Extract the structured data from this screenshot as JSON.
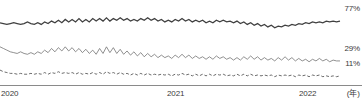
{
  "chart_data": {
    "type": "line",
    "title": "",
    "xlabel": "(年)",
    "ylabel": "",
    "grid": false,
    "legend_position": "right-end-labels",
    "xlim": [
      2020.0,
      2022.95
    ],
    "ylim": [
      0,
      100
    ],
    "x_tick_labels": [
      "2020",
      "2021",
      "2022"
    ],
    "x_tick_values": [
      2020,
      2021,
      2022
    ],
    "end_labels": [
      "77%",
      "29%",
      "11%"
    ],
    "series": [
      {
        "name": "77%",
        "end_label": "77%",
        "style": "solid-thick",
        "color": "#404040",
        "values": [
          75,
          74,
          73,
          74,
          75,
          74,
          73,
          74,
          76,
          74,
          73,
          75,
          73,
          76,
          74,
          77,
          75,
          78,
          75,
          79,
          76,
          79,
          76,
          80,
          76,
          79,
          76,
          80,
          77,
          80,
          77,
          81,
          77,
          80,
          78,
          81,
          78,
          80,
          77,
          79,
          77,
          80,
          78,
          81,
          78,
          80,
          77,
          79,
          76,
          78,
          76,
          79,
          77,
          80,
          77,
          79,
          76,
          78,
          76,
          78,
          75,
          77,
          75,
          78,
          76,
          78,
          76,
          77,
          75,
          77,
          74,
          76,
          73,
          75,
          72,
          74,
          71,
          73,
          70,
          72,
          69,
          71,
          70,
          72,
          71,
          73,
          72,
          74,
          73,
          75,
          74,
          76,
          75,
          76,
          75,
          77,
          76,
          77,
          76,
          77
        ]
      },
      {
        "name": "29%",
        "end_label": "29%",
        "style": "solid-thin",
        "color": "#6b6b6b",
        "values": [
          46,
          44,
          42,
          40,
          39,
          38,
          40,
          38,
          37,
          39,
          37,
          40,
          38,
          42,
          39,
          44,
          40,
          45,
          41,
          46,
          41,
          45,
          40,
          44,
          39,
          43,
          38,
          42,
          37,
          44,
          38,
          46,
          39,
          45,
          38,
          43,
          37,
          41,
          36,
          40,
          35,
          39,
          34,
          38,
          34,
          37,
          33,
          36,
          33,
          35,
          32,
          36,
          33,
          37,
          33,
          36,
          32,
          35,
          32,
          34,
          31,
          34,
          31,
          35,
          32,
          34,
          31,
          33,
          30,
          33,
          30,
          34,
          31,
          35,
          31,
          34,
          30,
          33,
          30,
          32,
          29,
          33,
          30,
          34,
          30,
          33,
          29,
          32,
          29,
          31,
          28,
          31,
          29,
          32,
          29,
          31,
          28,
          30,
          29,
          29
        ]
      },
      {
        "name": "11%",
        "end_label": "11%",
        "style": "dashed",
        "color": "#5a5a5a",
        "values": [
          18,
          16,
          15,
          14,
          14,
          13,
          14,
          13,
          13,
          14,
          13,
          14,
          13,
          15,
          13,
          15,
          14,
          16,
          14,
          15,
          14,
          15,
          13,
          15,
          13,
          14,
          13,
          15,
          13,
          15,
          13,
          16,
          14,
          15,
          13,
          15,
          13,
          14,
          12,
          14,
          12,
          14,
          12,
          14,
          12,
          13,
          12,
          13,
          12,
          13,
          11,
          13,
          12,
          14,
          12,
          13,
          11,
          13,
          11,
          13,
          11,
          13,
          11,
          13,
          12,
          13,
          11,
          12,
          11,
          13,
          11,
          13,
          11,
          13,
          11,
          12,
          11,
          12,
          11,
          12,
          10,
          12,
          11,
          12,
          11,
          12,
          10,
          12,
          11,
          12,
          10,
          12,
          11,
          12,
          10,
          11,
          10,
          11,
          10,
          11
        ]
      }
    ]
  },
  "axis": {
    "unit_label": "(年)"
  }
}
